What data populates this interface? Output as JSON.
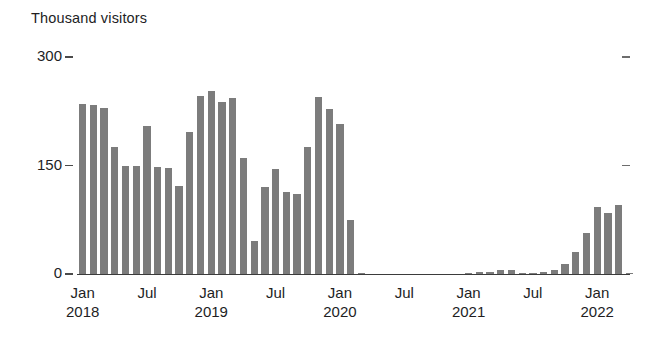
{
  "chart_data": {
    "type": "bar",
    "title": "",
    "subtitle": "",
    "xlabel": "",
    "ylabel": "Thousand visitors",
    "ylim": [
      0,
      300
    ],
    "yticks": [
      0,
      150,
      300
    ],
    "ytick_labels": [
      "0",
      "150",
      "300"
    ],
    "grid": false,
    "legend": null,
    "bar_color": "#7c7c7c",
    "axis_color": "#3b3b3b",
    "text_color": "#221e1f",
    "x_tick_labels": [
      {
        "month": "Jan",
        "year": "2018",
        "index": 0
      },
      {
        "month": "Jul",
        "year": "",
        "index": 6
      },
      {
        "month": "Jan",
        "year": "2019",
        "index": 12
      },
      {
        "month": "Jul",
        "year": "",
        "index": 18
      },
      {
        "month": "Jan",
        "year": "2020",
        "index": 24
      },
      {
        "month": "Jul",
        "year": "",
        "index": 30
      },
      {
        "month": "Jan",
        "year": "2021",
        "index": 36
      },
      {
        "month": "Jul",
        "year": "",
        "index": 42
      },
      {
        "month": "Jan",
        "year": "2022",
        "index": 48
      }
    ],
    "categories": [
      "Jan 2018",
      "Feb 2018",
      "Mar 2018",
      "Apr 2018",
      "May 2018",
      "Jun 2018",
      "Jul 2018",
      "Aug 2018",
      "Sep 2018",
      "Oct 2018",
      "Nov 2018",
      "Dec 2018",
      "Jan 2019",
      "Feb 2019",
      "Mar 2019",
      "Apr 2019",
      "May 2019",
      "Jun 2019",
      "Jul 2019",
      "Aug 2019",
      "Sep 2019",
      "Oct 2019",
      "Nov 2019",
      "Dec 2019",
      "Jan 2020",
      "Feb 2020",
      "Mar 2020",
      "Apr 2020",
      "May 2020",
      "Jun 2020",
      "Jul 2020",
      "Aug 2020",
      "Sep 2020",
      "Oct 2020",
      "Nov 2020",
      "Dec 2020",
      "Jan 2021",
      "Feb 2021",
      "Mar 2021",
      "Apr 2021",
      "May 2021",
      "Jun 2021",
      "Jul 2021",
      "Aug 2021",
      "Sep 2021",
      "Oct 2021",
      "Nov 2021",
      "Dec 2021",
      "Jan 2022",
      "Feb 2022",
      "Mar 2022",
      "Apr 2022"
    ],
    "values": [
      235,
      233,
      230,
      176,
      150,
      150,
      205,
      148,
      146,
      122,
      197,
      246,
      253,
      238,
      244,
      160,
      46,
      120,
      145,
      113,
      110,
      175,
      245,
      228,
      208,
      75,
      2,
      0,
      0,
      0,
      0,
      0,
      0,
      0,
      0,
      0,
      2,
      3,
      3,
      5,
      5,
      2,
      2,
      3,
      6,
      14,
      30,
      57,
      92,
      84,
      95,
      2
    ]
  }
}
